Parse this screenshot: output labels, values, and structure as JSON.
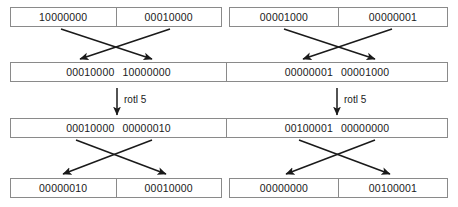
{
  "diagram": {
    "line_color": "#8a8a8a",
    "arrow_color": "#1a1a1a",
    "text_color": "#1a1a1a",
    "background": "#ffffff",
    "rows": [
      {
        "id": "row1",
        "layout": "split-halves",
        "left": {
          "cells": [
            "10000000",
            "00010000"
          ]
        },
        "right": {
          "cells": [
            "00001000",
            "00000001"
          ]
        }
      },
      {
        "id": "row2",
        "layout": "merged-pairs",
        "left": {
          "words": [
            "00010000",
            "10000000"
          ]
        },
        "right": {
          "words": [
            "00000001",
            "00001000"
          ]
        }
      },
      {
        "id": "row3",
        "layout": "merged-pairs",
        "left": {
          "words": [
            "00010000",
            "00000010"
          ]
        },
        "right": {
          "words": [
            "00100001",
            "00000000"
          ]
        }
      },
      {
        "id": "row4",
        "layout": "split-halves",
        "left": {
          "cells": [
            "00000010",
            "00010000"
          ]
        },
        "right": {
          "cells": [
            "00000000",
            "00100001"
          ]
        }
      }
    ],
    "operations": [
      {
        "id": "rotl-left",
        "label": "rotl 5"
      },
      {
        "id": "rotl-right",
        "label": "rotl 5"
      }
    ]
  }
}
